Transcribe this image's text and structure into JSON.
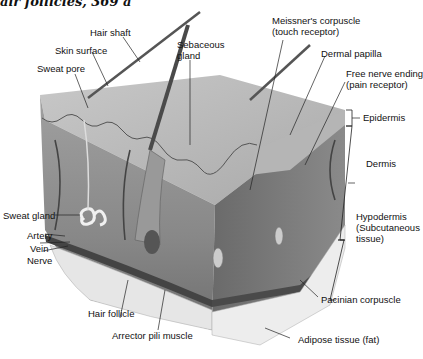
{
  "header": {
    "partial_text": "air follicles, 369 a"
  },
  "diagram": {
    "labels": {
      "hair_shaft": "Hair shaft",
      "skin_surface": "Skin surface",
      "sweat_pore": "Sweat pore",
      "sebaceous_gland_1": "Sebaceous",
      "sebaceous_gland_2": "gland",
      "meissner_1": "Meissner's corpuscle",
      "meissner_2": "(touch receptor)",
      "dermal_papilla": "Dermal papilla",
      "free_nerve_1": "Free nerve ending",
      "free_nerve_2": "(pain receptor)",
      "epidermis": "Epidermis",
      "dermis": "Dermis",
      "hypodermis_1": "Hypodermis",
      "hypodermis_2": "(Subcutaneous",
      "hypodermis_3": "tissue)",
      "sweat_gland": "Sweat gland",
      "artery": "Artery",
      "vein": "Vein",
      "nerve": "Nerve",
      "hair_follicle": "Hair follicle",
      "arrector_pili": "Arrector pili muscle",
      "pacinian": "Pacinian corpuscle",
      "adipose": "Adipose tissue (fat)"
    },
    "colors": {
      "skin_top": "#bdbdbd",
      "dermis": "#8c8c8c",
      "dark": "#5a5a5a",
      "fat": "#ececec",
      "line": "#222222"
    }
  }
}
